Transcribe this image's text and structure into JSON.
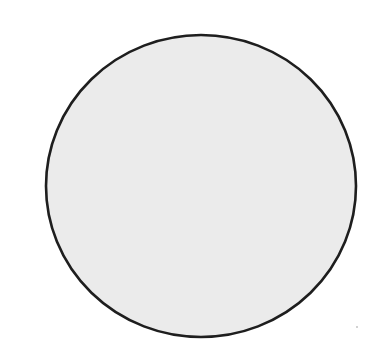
{
  "figure": {
    "shape": "circle",
    "fill_color": "#ebebeb",
    "stroke_color": "#1e1e1e",
    "background_color": "#ffffff"
  }
}
